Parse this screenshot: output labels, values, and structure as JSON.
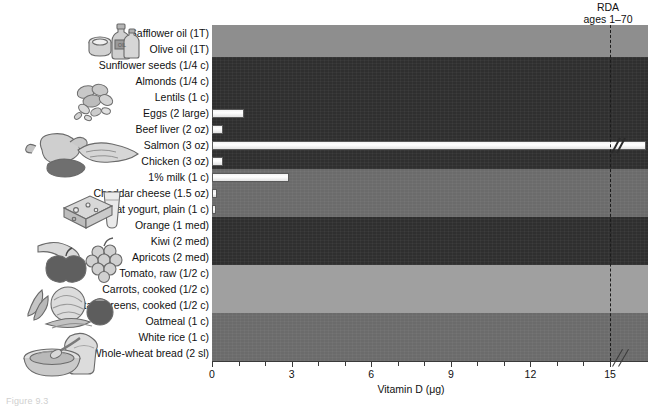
{
  "figure": {
    "caption": "Figure 9.3",
    "axis_title": "Vitamin D (μg)",
    "rda_label_line1": "RDA",
    "rda_label_line2": "ages 1–70",
    "rda_value": 15
  },
  "chart_data": {
    "type": "bar",
    "orientation": "horizontal",
    "title": "",
    "xlabel": "Vitamin D (μg)",
    "ylabel": "",
    "xlim": [
      0,
      15
    ],
    "xticks": [
      0,
      3,
      6,
      9,
      12,
      15
    ],
    "xtick_labels": [
      "0",
      "3",
      "6",
      "9",
      "12",
      "15"
    ],
    "minor_tick_interval": 1,
    "grid": false,
    "legend": null,
    "reference_line": {
      "value": 15,
      "style": "dashed",
      "label": "RDA ages 1–70"
    },
    "axis_break": true,
    "categories": [
      "Safflower oil (1T)",
      "Olive oil (1T)",
      "Sunflower seeds (1/4 c)",
      "Almonds (1/4 c)",
      "Lentils (1 c)",
      "Eggs (2 large)",
      "Beef liver (2 oz)",
      "Salmon (3 oz)",
      "Chicken (3 oz)",
      "1% milk (1 c)",
      "Cheddar cheese (1.5 oz)",
      "Low-fat yogurt, plain (1 c)",
      "Orange (1 med)",
      "Kiwi (2 med)",
      "Apricots (2 med)",
      "Tomato, raw (1/2 c)",
      "Carrots, cooked (1/2 c)",
      "Mustard greens, cooked (1/2 c)",
      "Oatmeal (1 c)",
      "White rice (1 c)",
      "Whole-wheat bread (2 sl)"
    ],
    "values": [
      0,
      0,
      0,
      0,
      0,
      1.2,
      0.4,
      16.5,
      0.4,
      2.9,
      0.2,
      0.15,
      0,
      0,
      0,
      0,
      0,
      0,
      0,
      0,
      0
    ],
    "value_broken": [
      false,
      false,
      false,
      false,
      false,
      false,
      false,
      true,
      false,
      false,
      false,
      false,
      false,
      false,
      false,
      false,
      false,
      false,
      false,
      false,
      false
    ],
    "food_groups": [
      {
        "name": "oils",
        "rows": 2,
        "shade": "light"
      },
      {
        "name": "protein",
        "rows": 7,
        "shade": "dark"
      },
      {
        "name": "dairy",
        "rows": 3,
        "shade": "mid"
      },
      {
        "name": "fruits",
        "rows": 3,
        "shade": "dark"
      },
      {
        "name": "vegetables",
        "rows": 3,
        "shade": "pale"
      },
      {
        "name": "grains",
        "rows": 3,
        "shade": "mid"
      }
    ]
  },
  "illustrations": [
    {
      "name": "oils-illustration",
      "alt": "bottles of oil and a tub"
    },
    {
      "name": "nuts-seeds-illustration",
      "alt": "almonds and seeds"
    },
    {
      "name": "meat-fish-illustration",
      "alt": "roast chicken, fish fillet and liver"
    },
    {
      "name": "dairy-illustration",
      "alt": "cheese wedge and glass of milk"
    },
    {
      "name": "fruits-illustration",
      "alt": "apple, grapes and banana"
    },
    {
      "name": "vegetables-illustration",
      "alt": "cabbage, carrots, tomato and asparagus"
    },
    {
      "name": "grains-illustration",
      "alt": "bowl of oatmeal and slice of bread"
    }
  ]
}
